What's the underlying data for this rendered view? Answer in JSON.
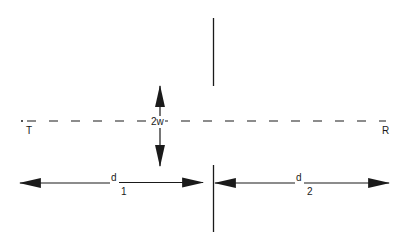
{
  "diagram": {
    "type": "line-of-sight geometry",
    "colors": {
      "background": "#ffffff",
      "stroke": "#1a1a1a"
    },
    "labels": {
      "transmitter": "T",
      "receiver": "R",
      "gap_width": "2w",
      "distance_1_symbol": "d",
      "distance_1_subscript": "1",
      "distance_2_symbol": "d",
      "distance_2_subscript": "2"
    },
    "elements": {
      "line_of_sight": "dashed horizontal line from T to R",
      "obstacle": "vertical screen with aperture of width 2w",
      "arrow_2w": "vertical double-headed arrow spanning the aperture",
      "arrow_d1": "horizontal double-headed arrow from T to screen",
      "arrow_d2": "horizontal double-headed arrow from screen to R"
    }
  }
}
